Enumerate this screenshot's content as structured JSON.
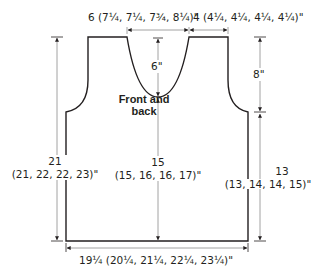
{
  "diagram": {
    "title": "Front and back",
    "title_line1": "Front and",
    "title_line2": "back",
    "colors": {
      "outline": "#231f20",
      "dimension_line": "#8a8a8a",
      "text": "#231f20"
    },
    "dimensions": {
      "neck_width": "6 (7¼, 7¼, 7¾, 8¼)\"",
      "shoulder_width": "4 (4¼, 4¼, 4¼, 4¼)\"",
      "neck_depth": "6\"",
      "armhole_depth": "8\"",
      "total_length_main": "21",
      "total_length_sizes": "(21, 22, 22, 23)\"",
      "center_length_main": "15",
      "center_length_sizes": "(15, 16, 16, 17)\"",
      "side_length_main": "13",
      "side_length_sizes": "(13, 14, 14, 15)\"",
      "width": "19¼ (20¼, 21¼, 22¼, 23¼)\""
    }
  }
}
